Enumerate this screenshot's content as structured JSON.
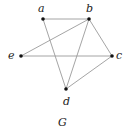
{
  "graph": {
    "caption": "G",
    "nodes": [
      {
        "id": "a",
        "label": "a",
        "x": 43,
        "y": 19,
        "lx": 38,
        "ly": 3
      },
      {
        "id": "b",
        "label": "b",
        "x": 89,
        "y": 19,
        "lx": 86,
        "ly": 3
      },
      {
        "id": "e",
        "label": "e",
        "x": 21,
        "y": 56,
        "lx": 8,
        "ly": 50
      },
      {
        "id": "c",
        "label": "c",
        "x": 112,
        "y": 56,
        "lx": 116,
        "ly": 50
      },
      {
        "id": "d",
        "label": "d",
        "x": 66,
        "y": 89,
        "lx": 63,
        "ly": 96
      }
    ],
    "edges": [
      [
        "a",
        "b"
      ],
      [
        "a",
        "d"
      ],
      [
        "b",
        "e"
      ],
      [
        "b",
        "d"
      ],
      [
        "b",
        "c"
      ],
      [
        "e",
        "c"
      ],
      [
        "c",
        "d"
      ]
    ],
    "colors": {
      "edge": "#9a9a9a",
      "node": "#111111"
    }
  }
}
